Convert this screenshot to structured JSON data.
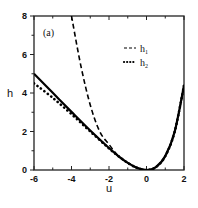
{
  "chart_data": {
    "type": "line",
    "title": "",
    "panel_label": "(a)",
    "xlabel": "u",
    "ylabel": "h",
    "xlim": [
      -6,
      2
    ],
    "ylim": [
      0,
      8
    ],
    "xticks": [
      -6,
      -4,
      -2,
      0,
      2
    ],
    "yticks": [
      0,
      2,
      4,
      6,
      8
    ],
    "grid": false,
    "legend_position": "upper right",
    "series": [
      {
        "name": "h",
        "style": "solid",
        "x": [
          -6,
          -5,
          -4,
          -3,
          -2,
          -1.5,
          -1,
          -0.5,
          0,
          0.5,
          1,
          1.5,
          2
        ],
        "values": [
          5.0,
          4.01,
          3.02,
          2.05,
          1.14,
          0.72,
          0.37,
          0.11,
          0.0,
          0.15,
          0.72,
          1.98,
          4.39
        ]
      },
      {
        "name": "h₁",
        "style": "dashed",
        "x": [
          -4,
          -3.5,
          -3,
          -2.5,
          -2,
          -1.5,
          -1,
          -0.5,
          0,
          0.5,
          1,
          1.5,
          2
        ],
        "values": [
          8.0,
          5.41,
          3.38,
          2.01,
          1.33,
          0.72,
          0.38,
          0.11,
          0.0,
          0.15,
          0.71,
          1.97,
          4.33
        ]
      },
      {
        "name": "h₂",
        "style": "dotted",
        "x": [
          -6,
          -5,
          -4,
          -3,
          -2,
          -1.5,
          -1,
          -0.5,
          0,
          0.5,
          1,
          1.5,
          2
        ],
        "values": [
          4.5,
          3.75,
          2.9,
          2.0,
          1.12,
          0.72,
          0.37,
          0.11,
          0.0,
          0.15,
          0.72,
          1.98,
          4.39
        ]
      }
    ]
  },
  "legend": {
    "items": [
      {
        "label": "h",
        "sub": "1",
        "style": "dashed"
      },
      {
        "label": "h",
        "sub": "2",
        "style": "dotted"
      }
    ]
  },
  "axes": {
    "x_tick_labels": [
      "-6",
      "-4",
      "-2",
      "0",
      "2"
    ],
    "y_tick_labels": [
      "0",
      "2",
      "4",
      "6",
      "8"
    ],
    "xlabel": "u",
    "ylabel": "h",
    "panel_label": "(a)"
  }
}
